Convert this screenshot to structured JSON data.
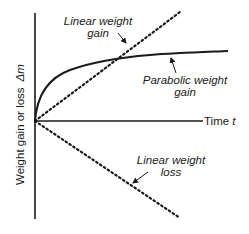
{
  "diagram": {
    "axes": {
      "y_label": "Weight gain or loss",
      "y_symbol": "Δm",
      "x_label": "Time",
      "x_symbol": "t"
    },
    "curves": [
      {
        "id": "linear-gain",
        "label_line1": "Linear weight",
        "label_line2": "gain",
        "style": "dotted",
        "shape": "line rising"
      },
      {
        "id": "parabolic-gain",
        "label_line1": "Parabolic weight",
        "label_line2": "gain",
        "style": "solid",
        "shape": "square-root curve"
      },
      {
        "id": "linear-loss",
        "label_line1": "Linear weight",
        "label_line2": "loss",
        "style": "dotted",
        "shape": "line falling"
      }
    ],
    "colors": {
      "line": "#1a1a1a",
      "background": "#ffffff"
    }
  }
}
